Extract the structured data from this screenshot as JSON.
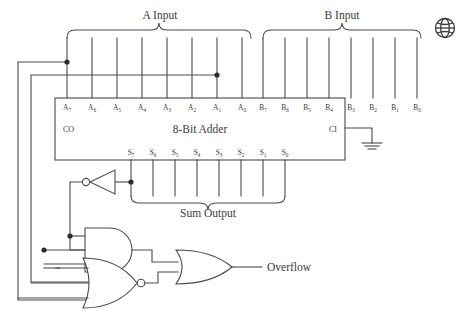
{
  "diagram": {
    "title_block": "8-Bit Adder",
    "group_labels": {
      "a": "A Input",
      "b": "B Input",
      "sum": "Sum Output"
    },
    "carry": {
      "out": "CO",
      "in": "CI"
    },
    "output_label": "Overflow",
    "a_pins": [
      {
        "name": "A",
        "sub": "7"
      },
      {
        "name": "A",
        "sub": "6"
      },
      {
        "name": "A",
        "sub": "5"
      },
      {
        "name": "A",
        "sub": "4"
      },
      {
        "name": "A",
        "sub": "3"
      },
      {
        "name": "A",
        "sub": "2"
      },
      {
        "name": "A",
        "sub": "1"
      },
      {
        "name": "A",
        "sub": "0"
      }
    ],
    "b_pins": [
      {
        "name": "B",
        "sub": "7"
      },
      {
        "name": "B",
        "sub": "6"
      },
      {
        "name": "B",
        "sub": "5"
      },
      {
        "name": "B",
        "sub": "4"
      },
      {
        "name": "B",
        "sub": "3"
      },
      {
        "name": "B",
        "sub": "2"
      },
      {
        "name": "B",
        "sub": "1"
      },
      {
        "name": "B",
        "sub": "0"
      }
    ],
    "s_pins": [
      {
        "name": "S",
        "sub": "7"
      },
      {
        "name": "S",
        "sub": "6"
      },
      {
        "name": "S",
        "sub": "5"
      },
      {
        "name": "S",
        "sub": "4"
      },
      {
        "name": "S",
        "sub": "3"
      },
      {
        "name": "S",
        "sub": "2"
      },
      {
        "name": "S",
        "sub": "1"
      },
      {
        "name": "S",
        "sub": "0"
      }
    ],
    "gates": [
      {
        "id": "inverter",
        "type": "NOT",
        "inputs": 1
      },
      {
        "id": "and-gate",
        "type": "AND",
        "inputs": 3
      },
      {
        "id": "nor-gate",
        "type": "NOR",
        "inputs": 3
      },
      {
        "id": "or-gate",
        "type": "OR",
        "inputs": 2
      }
    ],
    "symbols": {
      "ground": "ground-symbol",
      "globe": "globe-icon"
    },
    "colors": {
      "line": "#4a4a4a",
      "text": "#3b3b3b",
      "background": "#ffffff"
    }
  }
}
